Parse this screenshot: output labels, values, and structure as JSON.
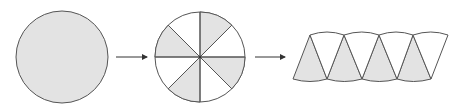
{
  "diagram": {
    "colors": {
      "fill": "#e3e3e3",
      "stroke": "#555555",
      "arrow": "#333333",
      "background": "#ffffff"
    },
    "steps": [
      {
        "id": "whole-circle",
        "label": "Whole circle"
      },
      {
        "id": "cut-circle",
        "label": "Circle cut into 8 sectors",
        "sectors": 8,
        "shaded_sectors": [
          0,
          2,
          4,
          6
        ]
      },
      {
        "id": "rearranged",
        "label": "Sectors rearranged into parallelogram-like strip",
        "pieces_up": 4,
        "pieces_down": 4
      }
    ],
    "arrows": [
      {
        "from": "whole-circle",
        "to": "cut-circle"
      },
      {
        "from": "cut-circle",
        "to": "rearranged"
      }
    ]
  }
}
